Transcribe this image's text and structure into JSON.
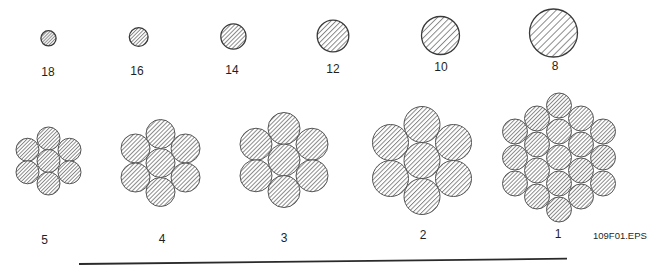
{
  "figure_id": "109F01.EPS",
  "colors": {
    "background": "#ffffff",
    "outline": "#3a3a3a",
    "strand_outline": "#555555",
    "hatch": "#6e6e6e",
    "text": "#1f1f1f",
    "rule": "#2a2a2a"
  },
  "solid_conductors": [
    {
      "gauge": "18",
      "strands": 1,
      "layout": {
        "cx": 48.5,
        "cy": 38.3,
        "r": 7.6,
        "hatch": 2.2,
        "label_x": 48,
        "label_y": 71.5
      }
    },
    {
      "gauge": "16",
      "strands": 1,
      "layout": {
        "cx": 138.7,
        "cy": 37.0,
        "r": 9.4,
        "hatch": 2.6,
        "label_x": 137,
        "label_y": 71
      }
    },
    {
      "gauge": "14",
      "strands": 1,
      "layout": {
        "cx": 233.4,
        "cy": 36.5,
        "r": 12.6,
        "hatch": 3.0,
        "label_x": 232,
        "label_y": 70
      }
    },
    {
      "gauge": "12",
      "strands": 1,
      "layout": {
        "cx": 333.0,
        "cy": 36.0,
        "r": 15.8,
        "hatch": 3.6,
        "label_x": 333,
        "label_y": 68.5
      }
    },
    {
      "gauge": "10",
      "strands": 1,
      "layout": {
        "cx": 440.5,
        "cy": 35.5,
        "r": 19.0,
        "hatch": 4.4,
        "label_x": 441,
        "label_y": 67
      }
    },
    {
      "gauge": "8",
      "strands": 1,
      "layout": {
        "cx": 553.5,
        "cy": 33.0,
        "r": 24.0,
        "hatch": 5.0,
        "label_x": 555,
        "label_y": 66
      }
    }
  ],
  "stranded_conductors": [
    {
      "gauge": "5",
      "strands": 7,
      "layout": {
        "cx": 48.5,
        "cy": 161.0,
        "r": 11.5,
        "dx": 21.0,
        "dy": 22.5,
        "rings": 1,
        "hatch": 2.6,
        "label_x": 44.5,
        "label_y": 239.5
      }
    },
    {
      "gauge": "4",
      "strands": 7,
      "layout": {
        "cx": 160.5,
        "cy": 163.0,
        "r": 14.5,
        "dx": 25.0,
        "dy": 29.0,
        "rings": 1,
        "hatch": 3.0,
        "label_x": 162,
        "label_y": 238.5
      }
    },
    {
      "gauge": "3",
      "strands": 7,
      "layout": {
        "cx": 284.0,
        "cy": 160.0,
        "r": 16.0,
        "dx": 28.0,
        "dy": 31.5,
        "rings": 1,
        "hatch": 3.0,
        "label_x": 284,
        "label_y": 237.5
      }
    },
    {
      "gauge": "2",
      "strands": 7,
      "layout": {
        "cx": 422.0,
        "cy": 160.5,
        "r": 18.0,
        "dx": 31.5,
        "dy": 36.0,
        "rings": 1,
        "hatch": 3.2,
        "label_x": 423,
        "label_y": 235
      }
    },
    {
      "gauge": "1",
      "strands": 19,
      "layout": {
        "cx": 559.0,
        "cy": 157.5,
        "r": 12.5,
        "dx": 22.0,
        "dy": 26.0,
        "rings": 2,
        "hatch": 2.8,
        "label_x": 558,
        "label_y": 234
      }
    }
  ]
}
